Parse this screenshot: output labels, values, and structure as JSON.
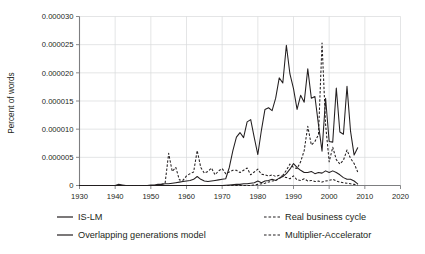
{
  "chart_data": {
    "type": "line",
    "title": "",
    "xlabel": "",
    "ylabel": "Percent of words",
    "xlim": [
      1930,
      2020
    ],
    "ylim": [
      0,
      3e-05
    ],
    "grid": true,
    "legend_position": "bottom",
    "xticks": [
      "1930",
      "1940",
      "1950",
      "1960",
      "1970",
      "1980",
      "1990",
      "2000",
      "2010",
      "2020"
    ],
    "yticks": [
      "0",
      "0.000005",
      "0.000010",
      "0.000015",
      "0.000020",
      "0.000025",
      "0.000030"
    ],
    "ytick_values": [
      0,
      5e-06,
      1e-05,
      1.5e-05,
      2e-05,
      2.5e-05,
      3e-05
    ],
    "xtick_values": [
      1930,
      1940,
      1950,
      1960,
      1970,
      1980,
      1990,
      2000,
      2010,
      2020
    ],
    "series": [
      {
        "name": "IS-LM",
        "style": "solid",
        "color": "#231f20",
        "x": [
          1930,
          1931,
          1932,
          1933,
          1934,
          1935,
          1936,
          1937,
          1938,
          1939,
          1940,
          1941,
          1942,
          1943,
          1944,
          1945,
          1946,
          1947,
          1948,
          1949,
          1950,
          1951,
          1952,
          1953,
          1954,
          1955,
          1956,
          1957,
          1958,
          1959,
          1960,
          1961,
          1962,
          1963,
          1964,
          1965,
          1966,
          1967,
          1968,
          1969,
          1970,
          1971,
          1972,
          1973,
          1974,
          1975,
          1976,
          1977,
          1978,
          1979,
          1980,
          1981,
          1982,
          1983,
          1984,
          1985,
          1986,
          1987,
          1988,
          1989,
          1990,
          1991,
          1992,
          1993,
          1994,
          1995,
          1996,
          1997,
          1998,
          1999,
          2000,
          2001,
          2002,
          2003,
          2004,
          2005,
          2006,
          2007,
          2008
        ],
        "values": [
          0,
          0,
          0,
          0,
          0,
          0,
          0,
          0,
          0,
          0,
          0,
          2e-07,
          1e-07,
          0,
          0,
          0,
          0,
          0,
          0,
          0,
          1e-07,
          1e-07,
          2e-07,
          2e-07,
          3e-07,
          3e-07,
          4e-07,
          5e-07,
          6e-07,
          7e-07,
          8e-07,
          9e-07,
          1.1e-06,
          1.6e-06,
          1.1e-06,
          8e-07,
          7e-07,
          8e-07,
          9e-07,
          1e-06,
          1.1e-06,
          1.2e-06,
          3.2e-06,
          6.2e-06,
          8.6e-06,
          9.4e-06,
          8.5e-06,
          1.13e-05,
          1.17e-05,
          8.5e-06,
          5.5e-06,
          9.8e-06,
          1.35e-05,
          1.38e-05,
          1.33e-05,
          1.55e-05,
          1.91e-05,
          1.82e-05,
          2.49e-05,
          1.98e-05,
          1.72e-05,
          1.35e-05,
          1.6e-05,
          1.48e-05,
          2.07e-05,
          1.55e-05,
          1.58e-05,
          1.08e-05,
          6.1e-06,
          1.55e-05,
          7.8e-06,
          7.7e-06,
          1.73e-05,
          9.5e-06,
          9.1e-06,
          1.76e-05,
          9.6e-06,
          5.4e-06,
          6.7e-06
        ]
      },
      {
        "name": "Overlapping generations model",
        "style": "solid",
        "color": "#231f20",
        "x": [
          1930,
          1935,
          1940,
          1945,
          1950,
          1955,
          1958,
          1960,
          1962,
          1964,
          1966,
          1968,
          1970,
          1972,
          1974,
          1975,
          1976,
          1977,
          1978,
          1979,
          1980,
          1981,
          1982,
          1983,
          1984,
          1985,
          1986,
          1987,
          1988,
          1989,
          1990,
          1991,
          1992,
          1993,
          1994,
          1995,
          1996,
          1997,
          1998,
          1999,
          2000,
          2001,
          2002,
          2003,
          2004,
          2005,
          2006,
          2007,
          2008
        ],
        "values": [
          0,
          0,
          0,
          0,
          0,
          0,
          0,
          0,
          0,
          0,
          0,
          0,
          0,
          1e-07,
          2e-07,
          2e-07,
          3e-07,
          3e-07,
          4e-07,
          5e-07,
          8e-07,
          5e-07,
          8e-07,
          9e-07,
          1.1e-06,
          9e-07,
          1.3e-06,
          1.6e-06,
          2.1e-06,
          2.9e-06,
          3.9e-06,
          3.2e-06,
          2.7e-06,
          2.3e-06,
          2.3e-06,
          2.5e-06,
          2.1e-06,
          2.3e-06,
          2.2e-06,
          2.6e-06,
          2.3e-06,
          2.6e-06,
          2.3e-06,
          1.9e-06,
          1.4e-06,
          1.1e-06,
          1.1e-06,
          8e-07,
          3e-07
        ]
      },
      {
        "name": "Real business cycle",
        "style": "dashed",
        "color": "#231f20",
        "x": [
          1930,
          1940,
          1950,
          1955,
          1960,
          1965,
          1970,
          1975,
          1978,
          1980,
          1982,
          1983,
          1984,
          1985,
          1986,
          1987,
          1988,
          1989,
          1990,
          1991,
          1992,
          1993,
          1994,
          1995,
          1996,
          1997,
          1998,
          1999,
          2000,
          2001,
          2002,
          2003,
          2004,
          2005,
          2006,
          2007,
          2008
        ],
        "values": [
          0,
          0,
          0,
          0,
          0,
          0,
          0,
          0,
          0,
          2e-07,
          4e-07,
          6e-07,
          8e-07,
          9e-07,
          1.2e-06,
          1.8e-06,
          2.7e-06,
          3.8e-06,
          3.2e-06,
          3e-06,
          4.2e-06,
          6.2e-06,
          1.05e-05,
          7.2e-06,
          7.8e-06,
          9e-06,
          2.53e-05,
          1.08e-05,
          4.2e-06,
          6.8e-06,
          4.6e-06,
          3.8e-06,
          4.5e-06,
          6.3e-06,
          4.8e-06,
          3.9e-06,
          2.4e-06
        ]
      },
      {
        "name": "Multiplier-Accelerator",
        "style": "dashed",
        "color": "#231f20",
        "x": [
          1930,
          1940,
          1948,
          1950,
          1952,
          1953,
          1954,
          1955,
          1956,
          1957,
          1958,
          1959,
          1960,
          1961,
          1962,
          1963,
          1964,
          1965,
          1966,
          1967,
          1968,
          1969,
          1970,
          1971,
          1972,
          1973,
          1974,
          1975,
          1976,
          1977,
          1978,
          1979,
          1980,
          1981,
          1982,
          1983,
          1984,
          1985,
          1986,
          1987,
          1988,
          1989,
          1990,
          1991,
          1992,
          1993,
          1994,
          1995,
          1996,
          1997,
          1998,
          1999,
          2000,
          2001,
          2002,
          2003,
          2004,
          2005,
          2006,
          2007,
          2008
        ],
        "values": [
          0,
          0,
          0,
          0,
          0,
          2e-07,
          4e-07,
          5.7e-06,
          2.5e-06,
          3.2e-06,
          1e-06,
          9e-07,
          1.7e-06,
          2.1e-06,
          2.4e-06,
          6.2e-06,
          3.2e-06,
          2.2e-06,
          2.5e-06,
          3.1e-06,
          1.9e-06,
          2.6e-06,
          3e-06,
          2.1e-06,
          2.4e-06,
          2.7e-06,
          2.7e-06,
          2.3e-06,
          2.7e-06,
          3.1e-06,
          1.9e-06,
          2.4e-06,
          2.9e-06,
          2e-06,
          1.9e-06,
          1.7e-06,
          1.9e-06,
          1.6e-06,
          1.8e-06,
          1.6e-06,
          1.4e-06,
          1.2e-06,
          1.7e-06,
          1e-06,
          9e-07,
          1.2e-06,
          8e-07,
          9e-07,
          7e-07,
          8e-07,
          6e-07,
          8e-07,
          9e-07,
          1.1e-06,
          8e-07,
          6e-07,
          5e-07,
          4e-07,
          3e-07,
          2e-07,
          1e-07
        ]
      }
    ]
  },
  "legend": {
    "entries": [
      {
        "label": "IS-LM",
        "style": "solid"
      },
      {
        "label": "Real business cycle",
        "style": "dashed"
      },
      {
        "label": "Overlapping generations model",
        "style": "solid"
      },
      {
        "label": "Multiplier-Accelerator",
        "style": "dashed"
      }
    ]
  }
}
